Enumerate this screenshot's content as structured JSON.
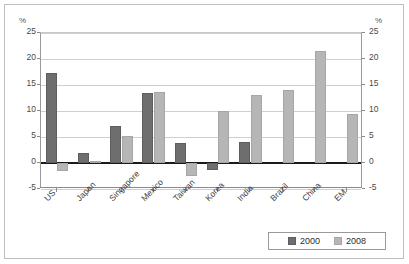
{
  "chart_data": {
    "type": "bar",
    "title": "",
    "subtitle": "",
    "xlabel": "",
    "ylabel": "%",
    "ylabel_right": "%",
    "ylim": [
      -5,
      25
    ],
    "ytick_step": 5,
    "yticks": [
      "25",
      "20",
      "15",
      "10",
      "5",
      "0",
      "-5"
    ],
    "ytick_values": [
      25,
      20,
      15,
      10,
      5,
      0,
      -5
    ],
    "grid": true,
    "grid_axis": "y",
    "zero_line": true,
    "legend_position": "bottom-right",
    "categories": [
      "US",
      "Japan",
      "Singapore",
      "Mexico",
      "Taiwan",
      "Korea",
      "India",
      "Brazil",
      "China",
      "EM"
    ],
    "series": [
      {
        "name": "2000",
        "color": "#6e6e6e",
        "values": [
          17.3,
          2.0,
          7.1,
          13.5,
          3.9,
          -1.3,
          4.0,
          null,
          null,
          null
        ]
      },
      {
        "name": "2008",
        "color": "#b6b6b6",
        "values": [
          -1.5,
          0.4,
          5.1,
          13.7,
          -2.5,
          10.0,
          13.1,
          14.0,
          21.5,
          9.4
        ]
      }
    ]
  },
  "axes": {
    "left_unit": "%",
    "right_unit": "%"
  },
  "legend": {
    "items": [
      {
        "label": "2000",
        "color": "#6e6e6e"
      },
      {
        "label": "2008",
        "color": "#b6b6b6"
      }
    ]
  },
  "colors": {
    "series_2000": "#6e6e6e",
    "series_2008": "#b6b6b6",
    "grid": "#cfcfcf",
    "zero_line": "#1a1a1a",
    "frame": "#bdbdbd"
  }
}
